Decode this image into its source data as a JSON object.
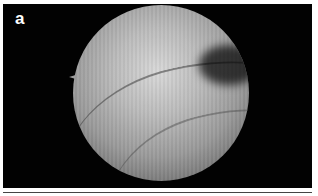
{
  "figure": {
    "panel_label": "a",
    "colors": {
      "background": "#020202",
      "label": "#ffffff",
      "frame": "#ffffff"
    }
  }
}
